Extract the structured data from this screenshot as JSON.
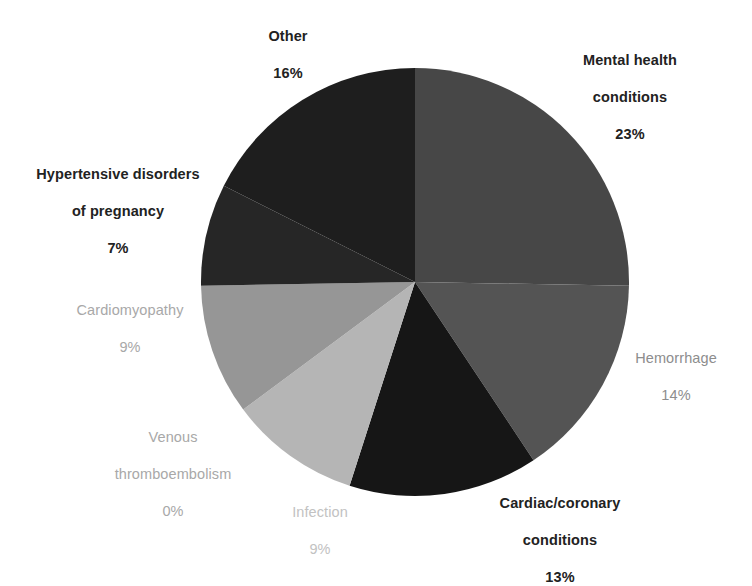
{
  "chart_data": {
    "type": "pie",
    "title": "",
    "subtitle": "",
    "legend_position": "labels-around-pie",
    "start_angle_deg": 0,
    "direction": "clockwise",
    "value_unit": "%",
    "total": 101,
    "categories": [
      "Mental health conditions",
      "Hemorrhage",
      "Cardiac/coronary conditions",
      "Infection",
      "Venous thromboembolism",
      "Cardiomyopathy",
      "Hypertensive disorders of pregnancy",
      "Other"
    ],
    "values": [
      23,
      14,
      13,
      9,
      0,
      9,
      7,
      16
    ],
    "colors": [
      "#474747",
      "#545454",
      "#161616",
      "#b5b5b5",
      "#7e7e7e",
      "#969696",
      "#262626",
      "#1e1e1e"
    ],
    "slices": [
      {
        "name": "Mental health conditions",
        "label_line1": "Mental health",
        "label_line2": "conditions",
        "percent_text": "23%",
        "value": 23,
        "color": "#474747",
        "label_style": "bold"
      },
      {
        "name": "Hemorrhage",
        "label_line1": "Hemorrhage",
        "label_line2": "",
        "percent_text": "14%",
        "value": 14,
        "color": "#545454",
        "label_style": "gray"
      },
      {
        "name": "Cardiac/coronary conditions",
        "label_line1": "Cardiac/coronary",
        "label_line2": "conditions",
        "percent_text": "13%",
        "value": 13,
        "color": "#161616",
        "label_style": "bold"
      },
      {
        "name": "Infection",
        "label_line1": "Infection",
        "label_line2": "",
        "percent_text": "9%",
        "value": 9,
        "color": "#b5b5b5",
        "label_style": "light"
      },
      {
        "name": "Venous thromboembolism",
        "label_line1": "Venous",
        "label_line2": "thromboembolism",
        "percent_text": "0%",
        "value": 0,
        "color": "#7e7e7e",
        "label_style": "mid"
      },
      {
        "name": "Cardiomyopathy",
        "label_line1": "Cardiomyopathy",
        "label_line2": "",
        "percent_text": "9%",
        "value": 9,
        "color": "#969696",
        "label_style": "mid"
      },
      {
        "name": "Hypertensive disorders of pregnancy",
        "label_line1": "Hypertensive disorders",
        "label_line2": "of pregnancy",
        "percent_text": "7%",
        "value": 7,
        "color": "#262626",
        "label_style": "bold"
      },
      {
        "name": "Other",
        "label_line1": "Other",
        "label_line2": "",
        "percent_text": "16%",
        "value": 16,
        "color": "#1e1e1e",
        "label_style": "bold"
      }
    ]
  },
  "labels": {
    "mental": {
      "line1": "Mental health",
      "line2": "conditions",
      "pct": "23%"
    },
    "hemorrhage": {
      "line1": "Hemorrhage",
      "line2": "",
      "pct": "14%"
    },
    "cardiac": {
      "line1": "Cardiac/coronary",
      "line2": "conditions",
      "pct": "13%"
    },
    "infection": {
      "line1": "Infection",
      "line2": "",
      "pct": "9%"
    },
    "vte": {
      "line1": "Venous",
      "line2": "thromboembolism",
      "pct": "0%"
    },
    "cardiomyo": {
      "line1": "Cardiomyopathy",
      "line2": "",
      "pct": "9%"
    },
    "htn": {
      "line1": "Hypertensive disorders",
      "line2": "of pregnancy",
      "pct": "7%"
    },
    "other": {
      "line1": "Other",
      "line2": "",
      "pct": "16%"
    }
  },
  "background_color": "#ffffff"
}
